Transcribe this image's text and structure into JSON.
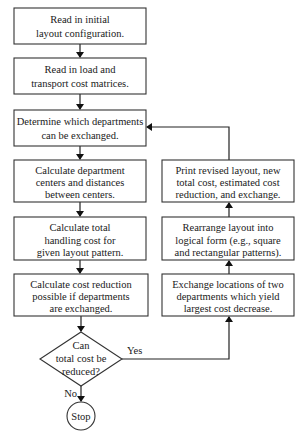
{
  "flowchart": {
    "nodes": [
      {
        "id": "read-layout",
        "type": "process",
        "lines": [
          "Read in initial",
          "layout configuration."
        ]
      },
      {
        "id": "read-matrices",
        "type": "process",
        "lines": [
          "Read in load and",
          "transport cost matrices."
        ]
      },
      {
        "id": "determine-exchange",
        "type": "process",
        "lines": [
          "Determine which departments",
          "can be exchanged."
        ]
      },
      {
        "id": "calc-centers",
        "type": "process",
        "lines": [
          "Calculate department",
          "centers and distances",
          "between centers."
        ]
      },
      {
        "id": "calc-handling",
        "type": "process",
        "lines": [
          "Calculate total",
          "handling cost for",
          "given layout pattern."
        ]
      },
      {
        "id": "calc-reduction",
        "type": "process",
        "lines": [
          "Calculate cost reduction",
          "possible if departments",
          "are exchanged."
        ]
      },
      {
        "id": "decision",
        "type": "decision",
        "lines": [
          "Can",
          "total cost be",
          "reduced?"
        ]
      },
      {
        "id": "stop",
        "type": "terminal",
        "lines": [
          "Stop"
        ]
      },
      {
        "id": "exchange-locations",
        "type": "process",
        "lines": [
          "Exchange locations of two",
          "departments which yield",
          "largest cost decrease."
        ]
      },
      {
        "id": "rearrange",
        "type": "process",
        "lines": [
          "Rearrange layout into",
          "logical form (e.g., square",
          "and rectangular patterns)."
        ]
      },
      {
        "id": "print-revised",
        "type": "process",
        "lines": [
          "Print revised layout, new",
          "total cost, estimated cost",
          "reduction, and exchange."
        ]
      }
    ],
    "edge_labels": {
      "yes": "Yes",
      "no": "No"
    },
    "edges": [
      {
        "from": "read-layout",
        "to": "read-matrices"
      },
      {
        "from": "read-matrices",
        "to": "determine-exchange"
      },
      {
        "from": "determine-exchange",
        "to": "calc-centers"
      },
      {
        "from": "calc-centers",
        "to": "calc-handling"
      },
      {
        "from": "calc-handling",
        "to": "calc-reduction"
      },
      {
        "from": "calc-reduction",
        "to": "decision"
      },
      {
        "from": "decision",
        "to": "exchange-locations",
        "label": "Yes"
      },
      {
        "from": "decision",
        "to": "stop",
        "label": "No"
      },
      {
        "from": "exchange-locations",
        "to": "rearrange"
      },
      {
        "from": "rearrange",
        "to": "print-revised"
      },
      {
        "from": "print-revised",
        "to": "determine-exchange"
      }
    ]
  }
}
